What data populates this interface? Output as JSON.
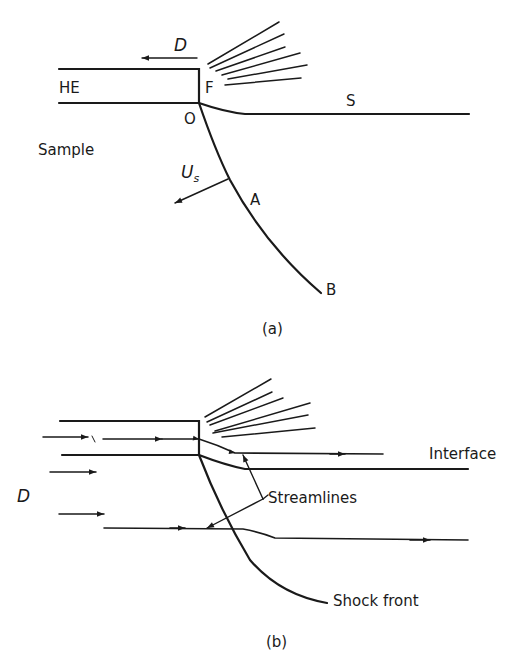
{
  "figure_a": {
    "caption": "(a)",
    "labels": {
      "detonation_velocity": "D",
      "high_explosive": "HE",
      "point_f": "F",
      "point_o": "O",
      "surface": "S",
      "sample": "Sample",
      "shock_velocity_main": "U",
      "shock_velocity_sub": "s",
      "point_a": "A",
      "point_b": "B"
    }
  },
  "figure_b": {
    "caption": "(b)",
    "labels": {
      "detonation_velocity": "D",
      "interface": "Interface",
      "streamlines": "Streamlines",
      "shock_front": "Shock front"
    }
  },
  "colors": {
    "ink": "#1a1a1a",
    "background": "#ffffff"
  }
}
